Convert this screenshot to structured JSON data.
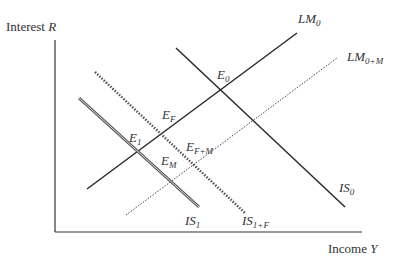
{
  "diagram": {
    "type": "IS-LM diagram",
    "y_axis_label": {
      "text": "Interest ",
      "var": "R"
    },
    "x_axis_label": {
      "text": "Income ",
      "var": "Y"
    },
    "curves": [
      {
        "id": "LM0",
        "main": "LM",
        "sub": "0",
        "style": "solid"
      },
      {
        "id": "LM0M",
        "main": "LM",
        "sub": "0+M",
        "style": "dotted"
      },
      {
        "id": "IS0",
        "main": "IS",
        "sub": "0",
        "style": "solid"
      },
      {
        "id": "IS1",
        "main": "IS",
        "sub": "1",
        "style": "double"
      },
      {
        "id": "IS1F",
        "main": "IS",
        "sub": "1+F",
        "style": "dashed-thick"
      }
    ],
    "points": [
      {
        "id": "E0",
        "main": "E",
        "sub": "0"
      },
      {
        "id": "EF",
        "main": "E",
        "sub": "F"
      },
      {
        "id": "E1",
        "main": "E",
        "sub": "1"
      },
      {
        "id": "EFM",
        "main": "E",
        "sub": "F+M"
      },
      {
        "id": "EM",
        "main": "E",
        "sub": "M"
      }
    ],
    "colors": {
      "line": "#2a2a2a",
      "double_line": "#555555",
      "text": "#333333"
    }
  }
}
